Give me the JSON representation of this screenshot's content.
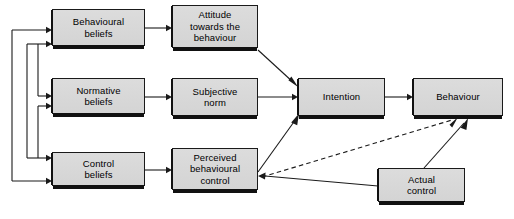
{
  "diagram": {
    "type": "flow-diagram",
    "canvas": {
      "width": 514,
      "height": 219
    },
    "style": {
      "box_fill": "#d8d8d8",
      "box_border": "#1a1a1a",
      "shadow": "#111111",
      "line": "#1a1a1a",
      "background": "#ffffff",
      "text": "#000000"
    },
    "nodes": [
      {
        "id": "behavioural_beliefs",
        "label": "Behavioural\nbeliefs",
        "x": 52,
        "y": 9,
        "w": 93,
        "h": 37
      },
      {
        "id": "attitude",
        "label": "Attitude\ntowards the\nbehaviour",
        "x": 172,
        "y": 5,
        "w": 86,
        "h": 43
      },
      {
        "id": "normative_beliefs",
        "label": "Normative\nbeliefs",
        "x": 52,
        "y": 78,
        "w": 93,
        "h": 36
      },
      {
        "id": "subjective_norm",
        "label": "Subjective\nnorm",
        "x": 172,
        "y": 78,
        "w": 86,
        "h": 38
      },
      {
        "id": "intention",
        "label": "Intention",
        "x": 298,
        "y": 78,
        "w": 87,
        "h": 38
      },
      {
        "id": "behaviour",
        "label": "Behaviour",
        "x": 413,
        "y": 78,
        "w": 90,
        "h": 38
      },
      {
        "id": "control_beliefs",
        "label": "Control\nbeliefs",
        "x": 52,
        "y": 152,
        "w": 93,
        "h": 34
      },
      {
        "id": "perceived_control",
        "label": "Perceived\nbehavioural\ncontrol",
        "x": 172,
        "y": 148,
        "w": 86,
        "h": 42
      },
      {
        "id": "actual_control",
        "label": "Actual\ncontrol",
        "x": 378,
        "y": 168,
        "w": 87,
        "h": 34
      }
    ],
    "edges": [
      {
        "id": "bb-att",
        "from": "behavioural_beliefs",
        "to": "attitude",
        "style": "solid"
      },
      {
        "id": "nb-sn",
        "from": "normative_beliefs",
        "to": "subjective_norm",
        "style": "solid"
      },
      {
        "id": "cb-pbc",
        "from": "control_beliefs",
        "to": "perceived_control",
        "style": "solid"
      },
      {
        "id": "att-int",
        "from": "attitude",
        "to": "intention",
        "style": "solid"
      },
      {
        "id": "sn-int",
        "from": "subjective_norm",
        "to": "intention",
        "style": "solid"
      },
      {
        "id": "pbc-int",
        "from": "perceived_control",
        "to": "intention",
        "style": "solid"
      },
      {
        "id": "int-beh",
        "from": "intention",
        "to": "behaviour",
        "style": "solid"
      },
      {
        "id": "pbc-beh",
        "from": "perceived_control",
        "to": "behaviour",
        "style": "dashed"
      },
      {
        "id": "ac-pbc",
        "from": "actual_control",
        "to": "perceived_control",
        "style": "solid"
      },
      {
        "id": "ac-beh",
        "from": "actual_control",
        "to": "behaviour",
        "style": "solid"
      },
      {
        "id": "fb-outer-bb",
        "from": "feedback-bus-outer",
        "to": "behavioural_beliefs",
        "style": "solid"
      },
      {
        "id": "fb-outer-cb",
        "from": "feedback-bus-outer",
        "to": "control_beliefs",
        "style": "solid"
      },
      {
        "id": "fb-inner-bb",
        "from": "feedback-bus-inner",
        "to": "behavioural_beliefs",
        "style": "solid"
      },
      {
        "id": "fb-inner-nb",
        "from": "feedback-bus-inner",
        "to": "normative_beliefs",
        "style": "solid"
      },
      {
        "id": "fb-mid-nb",
        "from": "feedback-bus-mid",
        "to": "normative_beliefs",
        "style": "solid"
      },
      {
        "id": "fb-mid-cb",
        "from": "feedback-bus-mid",
        "to": "control_beliefs",
        "style": "solid"
      }
    ]
  }
}
